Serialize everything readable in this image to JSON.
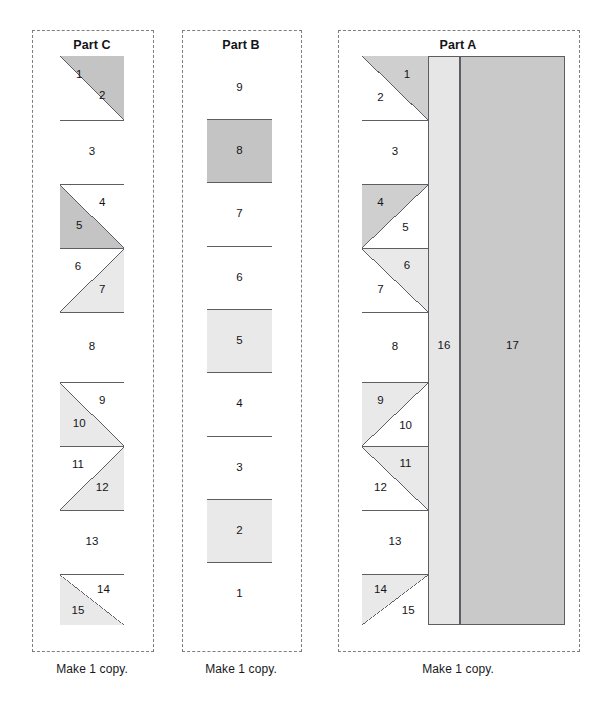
{
  "document": {
    "type": "quilt-foundation-paper-piecing-pattern",
    "caption_text": "Make 1 copy."
  },
  "palette": {
    "white": "#ffffff",
    "light_gray": "#e9e9e9",
    "mid_gray": "#cfcfcf",
    "dark_gray": "#c4c4c4",
    "strip16": "#e6e6e6",
    "strip17": "#c9c9c9",
    "line": "#5d5d63",
    "dash": "#7d7d85",
    "text": "#141418"
  },
  "panels": [
    {
      "id": "part-c",
      "title": "Part C",
      "caption": "Make 1 copy.",
      "frame": {
        "x": 32,
        "y": 30,
        "w": 120,
        "h": 620
      },
      "block": {
        "x": 60,
        "y": 56,
        "w": 64,
        "h": 569
      },
      "rows": [
        {
          "kind": "hst",
          "orientation": "shade-right-top",
          "top": 0,
          "h": 64,
          "pieces": [
            {
              "n": "1",
              "fill": "white",
              "lx": 0.3,
              "ly": 0.3
            },
            {
              "n": "2",
              "fill": "dark_gray",
              "lx": 0.66,
              "ly": 0.62
            }
          ]
        },
        {
          "kind": "plain",
          "top": 64,
          "h": 64,
          "pieces": [
            {
              "n": "3",
              "fill": "white",
              "lx": 0.5,
              "ly": 0.5
            }
          ]
        },
        {
          "kind": "hst",
          "orientation": "shade-right-top",
          "top": 128,
          "h": 64,
          "pieces": [
            {
              "n": "4",
              "fill": "dark_gray",
              "lx": 0.66,
              "ly": 0.3
            },
            {
              "n": "5",
              "fill": "white",
              "lx": 0.3,
              "ly": 0.66
            }
          ]
        },
        {
          "kind": "hst",
          "orientation": "shade-right-bottom",
          "top": 192,
          "h": 64,
          "pieces": [
            {
              "n": "6",
              "fill": "white",
              "lx": 0.28,
              "ly": 0.3
            },
            {
              "n": "7",
              "fill": "light_gray",
              "lx": 0.66,
              "ly": 0.66
            }
          ]
        },
        {
          "kind": "plain",
          "top": 256,
          "h": 70,
          "pieces": [
            {
              "n": "8",
              "fill": "white",
              "lx": 0.5,
              "ly": 0.5
            }
          ]
        },
        {
          "kind": "hst",
          "orientation": "shade-right-top",
          "top": 326,
          "h": 64,
          "pieces": [
            {
              "n": "9",
              "fill": "light_gray",
              "lx": 0.66,
              "ly": 0.3
            },
            {
              "n": "10",
              "fill": "white",
              "lx": 0.3,
              "ly": 0.66
            }
          ]
        },
        {
          "kind": "hst",
          "orientation": "shade-right-bottom",
          "top": 390,
          "h": 64,
          "pieces": [
            {
              "n": "11",
              "fill": "white",
              "lx": 0.28,
              "ly": 0.3
            },
            {
              "n": "12",
              "fill": "light_gray",
              "lx": 0.66,
              "ly": 0.66
            }
          ]
        },
        {
          "kind": "plain",
          "top": 454,
          "h": 64,
          "pieces": [
            {
              "n": "13",
              "fill": "white",
              "lx": 0.5,
              "ly": 0.5
            }
          ]
        },
        {
          "kind": "hst",
          "orientation": "shade-right-top",
          "top": 518,
          "h": 51,
          "pieces": [
            {
              "n": "14",
              "fill": "light_gray",
              "lx": 0.68,
              "ly": 0.32
            },
            {
              "n": "15",
              "fill": "white",
              "lx": 0.28,
              "ly": 0.72
            }
          ]
        }
      ],
      "strips": []
    },
    {
      "id": "part-b",
      "title": "Part B",
      "caption": "Make 1 copy.",
      "frame": {
        "x": 182,
        "y": 30,
        "w": 118,
        "h": 620
      },
      "block": {
        "x": 207,
        "y": 56,
        "w": 65,
        "h": 569
      },
      "rows": [
        {
          "kind": "plain",
          "top": 0,
          "h": 63,
          "pieces": [
            {
              "n": "9",
              "fill": "white",
              "lx": 0.5,
              "ly": 0.5
            }
          ]
        },
        {
          "kind": "plain",
          "top": 63,
          "h": 63,
          "pieces": [
            {
              "n": "8",
              "fill": "dark_gray",
              "lx": 0.5,
              "ly": 0.5
            }
          ]
        },
        {
          "kind": "plain",
          "top": 126,
          "h": 64,
          "pieces": [
            {
              "n": "7",
              "fill": "white",
              "lx": 0.5,
              "ly": 0.5
            }
          ]
        },
        {
          "kind": "plain",
          "top": 190,
          "h": 63,
          "pieces": [
            {
              "n": "6",
              "fill": "white",
              "lx": 0.5,
              "ly": 0.5
            }
          ]
        },
        {
          "kind": "plain",
          "top": 253,
          "h": 63,
          "pieces": [
            {
              "n": "5",
              "fill": "light_gray",
              "lx": 0.5,
              "ly": 0.5
            }
          ]
        },
        {
          "kind": "plain",
          "top": 316,
          "h": 64,
          "pieces": [
            {
              "n": "4",
              "fill": "white",
              "lx": 0.5,
              "ly": 0.5
            }
          ]
        },
        {
          "kind": "plain",
          "top": 380,
          "h": 63,
          "pieces": [
            {
              "n": "3",
              "fill": "white",
              "lx": 0.5,
              "ly": 0.5
            }
          ]
        },
        {
          "kind": "plain",
          "top": 443,
          "h": 63,
          "pieces": [
            {
              "n": "2",
              "fill": "light_gray",
              "lx": 0.5,
              "ly": 0.5
            }
          ]
        },
        {
          "kind": "plain",
          "top": 506,
          "h": 63,
          "pieces": [
            {
              "n": "1",
              "fill": "white",
              "lx": 0.5,
              "ly": 0.5
            }
          ]
        }
      ],
      "strips": []
    },
    {
      "id": "part-a",
      "title": "Part A",
      "caption": "Make 1 copy.",
      "frame": {
        "x": 338,
        "y": 30,
        "w": 240,
        "h": 620
      },
      "block": {
        "x": 362,
        "y": 56,
        "w": 203,
        "h": 569
      },
      "column_width": 66,
      "rows": [
        {
          "kind": "hst",
          "orientation": "shade-left-bottom",
          "top": 0,
          "h": 64,
          "pieces": [
            {
              "n": "1",
              "fill": "white",
              "lx": 0.68,
              "ly": 0.3
            },
            {
              "n": "2",
              "fill": "mid_gray",
              "lx": 0.28,
              "ly": 0.66
            }
          ]
        },
        {
          "kind": "plain",
          "top": 64,
          "h": 64,
          "pieces": [
            {
              "n": "3",
              "fill": "white",
              "lx": 0.5,
              "ly": 0.5
            }
          ]
        },
        {
          "kind": "hst",
          "orientation": "shade-left-top",
          "top": 128,
          "h": 64,
          "pieces": [
            {
              "n": "4",
              "fill": "mid_gray",
              "lx": 0.28,
              "ly": 0.3
            },
            {
              "n": "5",
              "fill": "white",
              "lx": 0.66,
              "ly": 0.68
            }
          ]
        },
        {
          "kind": "hst",
          "orientation": "shade-left-bottom",
          "top": 192,
          "h": 64,
          "pieces": [
            {
              "n": "6",
              "fill": "white",
              "lx": 0.68,
              "ly": 0.28
            },
            {
              "n": "7",
              "fill": "light_gray",
              "lx": 0.28,
              "ly": 0.66
            }
          ]
        },
        {
          "kind": "plain",
          "top": 256,
          "h": 70,
          "pieces": [
            {
              "n": "8",
              "fill": "white",
              "lx": 0.5,
              "ly": 0.5
            }
          ]
        },
        {
          "kind": "hst",
          "orientation": "shade-left-top",
          "top": 326,
          "h": 64,
          "pieces": [
            {
              "n": "9",
              "fill": "light_gray",
              "lx": 0.28,
              "ly": 0.3
            },
            {
              "n": "10",
              "fill": "white",
              "lx": 0.66,
              "ly": 0.68
            }
          ]
        },
        {
          "kind": "hst",
          "orientation": "shade-left-bottom",
          "top": 390,
          "h": 64,
          "pieces": [
            {
              "n": "11",
              "fill": "white",
              "lx": 0.66,
              "ly": 0.28
            },
            {
              "n": "12",
              "fill": "light_gray",
              "lx": 0.28,
              "ly": 0.66
            }
          ]
        },
        {
          "kind": "plain",
          "top": 454,
          "h": 64,
          "pieces": [
            {
              "n": "13",
              "fill": "white",
              "lx": 0.5,
              "ly": 0.5
            }
          ]
        },
        {
          "kind": "hst",
          "orientation": "shade-left-top",
          "top": 518,
          "h": 51,
          "pieces": [
            {
              "n": "14",
              "fill": "light_gray",
              "lx": 0.28,
              "ly": 0.32
            },
            {
              "n": "15",
              "fill": "white",
              "lx": 0.7,
              "ly": 0.72
            }
          ]
        }
      ],
      "strips": [
        {
          "n": "16",
          "fill": "strip16",
          "x": 66,
          "w": 32,
          "label_y": 0.51
        },
        {
          "n": "17",
          "fill": "strip17",
          "x": 98,
          "w": 105,
          "label_y": 0.51
        }
      ]
    }
  ]
}
